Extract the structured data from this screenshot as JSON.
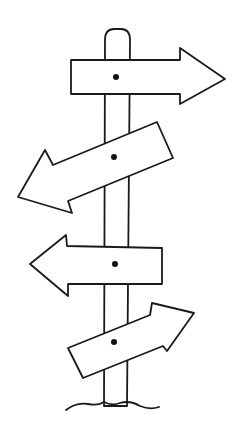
{
  "illustration": {
    "title": "Hand-drawn signpost with four arrows",
    "colors": {
      "ink": "#1a1a1a",
      "background": "#ffffff"
    },
    "signs": [
      {
        "direction": "right",
        "position": "top"
      },
      {
        "direction": "left",
        "position": "upper-middle",
        "tilted": true
      },
      {
        "direction": "left",
        "position": "lower-middle"
      },
      {
        "direction": "right",
        "position": "bottom",
        "tilted": true
      }
    ]
  }
}
